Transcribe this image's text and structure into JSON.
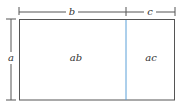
{
  "diagram": {
    "dimensions": {
      "top_left_segment": "b",
      "top_right_segment": "c",
      "left_side": "a"
    },
    "regions": [
      {
        "label": "ab"
      },
      {
        "label": "ac"
      }
    ],
    "colors": {
      "outline": "#555555",
      "divider": "#5aa0d8",
      "text": "#333333"
    }
  }
}
